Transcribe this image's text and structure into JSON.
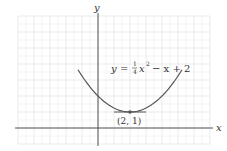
{
  "chart_data": {
    "type": "line",
    "title": "",
    "xlabel": "x",
    "ylabel": "y",
    "equation": "y = (1/4)x^2 - x + 2",
    "equation_parts": {
      "y": "y",
      "eq": "=",
      "num": "1",
      "den": "4",
      "x": "x",
      "exp": "2",
      "rest": "− x + 2"
    },
    "annotation": "(2, 1)",
    "vertex": {
      "x": 2,
      "y": 1
    },
    "xlim": [
      -5,
      7
    ],
    "ylim": [
      -1,
      7
    ],
    "grid": true,
    "series": [
      {
        "name": "y = 1/4 x^2 - x + 2",
        "x_range": [
          -1.25,
          5.25
        ]
      }
    ],
    "colors": {
      "curve": "#555555",
      "axis": "#555555",
      "grid": "#dddddd",
      "point": "#555555"
    }
  }
}
